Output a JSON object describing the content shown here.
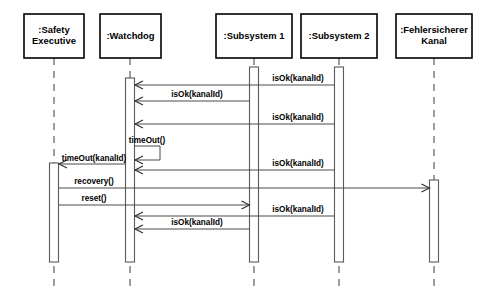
{
  "diagram": {
    "type": "uml-sequence-diagram",
    "width": 496,
    "height": 300,
    "background_color": "#ffffff",
    "line_color": "#4a4a4a",
    "box_border_color": "#000000",
    "lifeline_dash_color": "#6b6b6b"
  },
  "lifelines": [
    {
      "id": "safety-executive",
      "label_lines": [
        "SafetyExecutive"
      ],
      "label_line_1": ":Safety",
      "label_line_2": "Executive",
      "x": 54,
      "box": {
        "x": 24,
        "y": 14,
        "width": 60,
        "height": 44
      },
      "activations": [
        {
          "x": 49.5,
          "y": 163,
          "width": 9,
          "height": 99
        }
      ]
    },
    {
      "id": "watchdog",
      "label_lines": [
        "Watchdog"
      ],
      "label_line_1": ":Watchdog",
      "label_line_2": "",
      "x": 130,
      "box": {
        "x": 100,
        "y": 14,
        "width": 61,
        "height": 44
      },
      "activations": [
        {
          "x": 125.5,
          "y": 78,
          "width": 9,
          "height": 184
        }
      ]
    },
    {
      "id": "subsystem-1",
      "label_lines": [
        "Subsystem 1"
      ],
      "label_line_1": ":Subsystem 1",
      "label_line_2": "",
      "x": 254,
      "box": {
        "x": 216,
        "y": 14,
        "width": 76,
        "height": 44
      },
      "activations": [
        {
          "x": 249.5,
          "y": 67,
          "width": 9,
          "height": 195
        }
      ]
    },
    {
      "id": "subsystem-2",
      "label_lines": [
        "Subsystem 2"
      ],
      "label_line_1": ":Subsystem 2",
      "label_line_2": "",
      "x": 339,
      "box": {
        "x": 301,
        "y": 14,
        "width": 76,
        "height": 44
      },
      "activations": [
        {
          "x": 334.5,
          "y": 67,
          "width": 9,
          "height": 195
        }
      ]
    },
    {
      "id": "fehlersicherer-kanal",
      "label_lines": [
        "Fehlersicherer Kanal"
      ],
      "label_line_1": ":Fehlersicherer",
      "label_line_2": "Kanal",
      "x": 434,
      "box": {
        "x": 396,
        "y": 14,
        "width": 76,
        "height": 44
      },
      "activations": [
        {
          "x": 429.5,
          "y": 180,
          "width": 9,
          "height": 82
        }
      ]
    }
  ],
  "lifeline_dash": {
    "top": 58,
    "bottom": 288
  },
  "messages": [
    {
      "id": "msg-1",
      "label": "isOk(kanalId)",
      "from": "subsystem-2",
      "to": "watchdog",
      "direction": "left",
      "y": 85,
      "x_start": 334.5,
      "x_end": 135,
      "label_x": 298,
      "label_y": 81
    },
    {
      "id": "msg-2",
      "label": "isOk(kanalId)",
      "from": "subsystem-1",
      "to": "watchdog",
      "direction": "left",
      "y": 101,
      "x_start": 249.5,
      "x_end": 135,
      "label_x": 197,
      "label_y": 97
    },
    {
      "id": "msg-3",
      "label": "isOk(kanalId)",
      "from": "subsystem-2",
      "to": "watchdog",
      "direction": "left",
      "y": 124,
      "x_start": 334.5,
      "x_end": 135,
      "label_x": 298,
      "label_y": 120
    },
    {
      "id": "msg-4-self",
      "label": "timeOut()",
      "from": "watchdog",
      "to": "watchdog",
      "direction": "self",
      "y": 146,
      "y_return": 160,
      "x_start": 135,
      "x_extent": 160,
      "label_x": 147,
      "label_y": 143
    },
    {
      "id": "msg-5",
      "label": "timeOut(kanalId)",
      "from": "watchdog",
      "to": "safety-executive",
      "direction": "left",
      "y": 164,
      "x_start": 125.5,
      "x_end": 59,
      "label_x": 94,
      "label_y": 161
    },
    {
      "id": "msg-6",
      "label": "isOk(kanalId)",
      "from": "subsystem-2",
      "to": "watchdog",
      "direction": "left",
      "y": 170,
      "x_start": 334.5,
      "x_end": 135,
      "label_x": 298,
      "label_y": 166
    },
    {
      "id": "msg-7",
      "label": "recovery()",
      "from": "safety-executive",
      "to": "fehlersicherer-kanal",
      "direction": "right",
      "y": 188,
      "x_start": 59,
      "x_end": 429.5,
      "label_x": 94,
      "label_y": 184
    },
    {
      "id": "msg-8",
      "label": "reset()",
      "from": "safety-executive",
      "to": "subsystem-1",
      "direction": "right",
      "y": 205,
      "x_start": 59,
      "x_end": 249.5,
      "label_x": 94,
      "label_y": 201
    },
    {
      "id": "msg-9",
      "label": "isOk(kanalId)",
      "from": "subsystem-2",
      "to": "watchdog",
      "direction": "left",
      "y": 216,
      "x_start": 334.5,
      "x_end": 135,
      "label_x": 298,
      "label_y": 212
    },
    {
      "id": "msg-10",
      "label": "isOk(kanalId)",
      "from": "subsystem-1",
      "to": "watchdog",
      "direction": "left",
      "y": 229,
      "x_start": 249.5,
      "x_end": 135,
      "label_x": 197,
      "label_y": 225
    }
  ]
}
